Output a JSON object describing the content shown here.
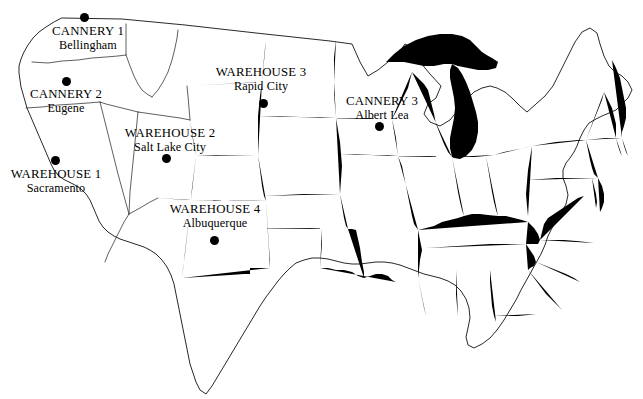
{
  "map": {
    "title": "United States Map with Cannery and Warehouse Locations",
    "region": "Continental United States",
    "background_color": "#ffffff",
    "border_color": "#1a1a1a",
    "marker_color": "#000000"
  },
  "sites": [
    {
      "id": "cannery-1",
      "type": "Cannery",
      "name": "CANNERY 1",
      "city": "Bellingham",
      "state_hint": "Washington",
      "dot": {
        "x": 84,
        "y": 17
      },
      "label": {
        "x": 88,
        "y": 25,
        "align": "center"
      }
    },
    {
      "id": "cannery-2",
      "type": "Cannery",
      "name": "CANNERY 2",
      "city": "Eugene",
      "state_hint": "Oregon",
      "dot": {
        "x": 66,
        "y": 81
      },
      "label": {
        "x": 66,
        "y": 88,
        "align": "center"
      }
    },
    {
      "id": "cannery-3",
      "type": "Cannery",
      "name": "CANNERY 3",
      "city": "Albert Lea",
      "state_hint": "Minnesota",
      "dot": {
        "x": 379,
        "y": 126
      },
      "label": {
        "x": 382,
        "y": 95,
        "align": "center"
      }
    },
    {
      "id": "warehouse-1",
      "type": "Warehouse",
      "name": "WAREHOUSE 1",
      "city": "Sacramento",
      "state_hint": "California",
      "dot": {
        "x": 55,
        "y": 160
      },
      "label": {
        "x": 56,
        "y": 168,
        "align": "center"
      }
    },
    {
      "id": "warehouse-2",
      "type": "Warehouse",
      "name": "WAREHOUSE 2",
      "city": "Salt Lake City",
      "state_hint": "Utah",
      "dot": {
        "x": 166,
        "y": 158
      },
      "label": {
        "x": 170,
        "y": 127,
        "align": "center"
      }
    },
    {
      "id": "warehouse-3",
      "type": "Warehouse",
      "name": "WAREHOUSE 3",
      "city": "Rapid City",
      "state_hint": "South Dakota",
      "dot": {
        "x": 263,
        "y": 103
      },
      "label": {
        "x": 261,
        "y": 71,
        "align": "center"
      }
    },
    {
      "id": "warehouse-4",
      "type": "Warehouse",
      "name": "WAREHOUSE 4",
      "city": "Albuquerque",
      "state_hint": "New Mexico",
      "dot": {
        "x": 214,
        "y": 240,
        "y_note": "below label"
      },
      "label": {
        "x": 215,
        "y": 204,
        "align": "center"
      }
    }
  ]
}
